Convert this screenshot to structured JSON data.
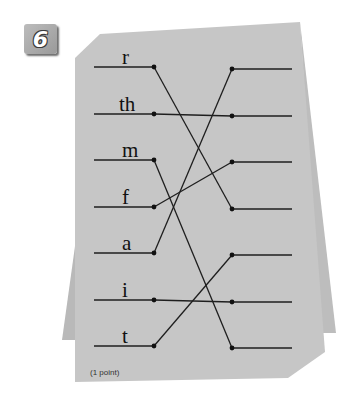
{
  "question": {
    "number": "6",
    "points_label": "(1 point)"
  },
  "left_items": [
    {
      "label": "r",
      "y": 67
    },
    {
      "label": "th",
      "y": 114
    },
    {
      "label": "m",
      "y": 160
    },
    {
      "label": "f",
      "y": 207
    },
    {
      "label": "a",
      "y": 253
    },
    {
      "label": "i",
      "y": 300
    },
    {
      "label": "t",
      "y": 346
    }
  ],
  "right_slots_y": [
    69,
    116,
    162,
    209,
    255,
    302,
    348
  ],
  "connections": [
    {
      "from": "r",
      "to_slot": 4
    },
    {
      "from": "th",
      "to_slot": 2
    },
    {
      "from": "m",
      "to_slot": 7
    },
    {
      "from": "f",
      "to_slot": 3
    },
    {
      "from": "a",
      "to_slot": 1
    },
    {
      "from": "i",
      "to_slot": 6
    },
    {
      "from": "t",
      "to_slot": 5
    }
  ],
  "colors": {
    "paper": "#c4c4c4",
    "paper_back": "#b8b8b8",
    "ink": "#1e1e1e"
  }
}
